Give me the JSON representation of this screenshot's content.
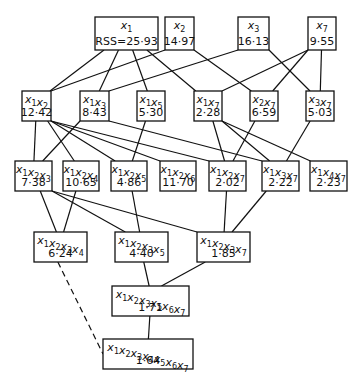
{
  "diagram": {
    "nodes": [
      {
        "id": "x1",
        "vars": [
          1
        ],
        "value": "RSS=25·93",
        "x": 95,
        "y": 17,
        "w": 63,
        "h": 33
      },
      {
        "id": "x2",
        "vars": [
          2
        ],
        "value": "14·97",
        "x": 165,
        "y": 17,
        "w": 29,
        "h": 33
      },
      {
        "id": "x3",
        "vars": [
          3
        ],
        "value": "16·13",
        "x": 238,
        "y": 17,
        "w": 31,
        "h": 33
      },
      {
        "id": "x7",
        "vars": [
          7
        ],
        "value": "9·55",
        "x": 308,
        "y": 17,
        "w": 28,
        "h": 33
      },
      {
        "id": "x1x2",
        "vars": [
          1,
          2
        ],
        "value": "12·42",
        "x": 22,
        "y": 91,
        "w": 29,
        "h": 30
      },
      {
        "id": "x1x3",
        "vars": [
          1,
          3
        ],
        "value": "8·43",
        "x": 80,
        "y": 91,
        "w": 29,
        "h": 30
      },
      {
        "id": "x1x5",
        "vars": [
          1,
          5
        ],
        "value": "5·30",
        "x": 137,
        "y": 91,
        "w": 28,
        "h": 30
      },
      {
        "id": "x1x7",
        "vars": [
          1,
          7
        ],
        "value": "2·28",
        "x": 194,
        "y": 91,
        "w": 28,
        "h": 30
      },
      {
        "id": "x2x7",
        "vars": [
          2,
          7
        ],
        "value": "6·59",
        "x": 250,
        "y": 91,
        "w": 28,
        "h": 30
      },
      {
        "id": "x3x7",
        "vars": [
          3,
          7
        ],
        "value": "5·03",
        "x": 306,
        "y": 91,
        "w": 28,
        "h": 30
      },
      {
        "id": "x1x2x3",
        "vars": [
          1,
          2,
          3
        ],
        "value": "7·38",
        "x": 15,
        "y": 161,
        "w": 37,
        "h": 30
      },
      {
        "id": "x1x2x4",
        "vars": [
          1,
          2,
          4
        ],
        "value": "10·65",
        "x": 63,
        "y": 161,
        "w": 36,
        "h": 30
      },
      {
        "id": "x1x2x5",
        "vars": [
          1,
          2,
          5
        ],
        "value": "4·86",
        "x": 111,
        "y": 161,
        "w": 36,
        "h": 30
      },
      {
        "id": "x1x2x6",
        "vars": [
          1,
          2,
          6
        ],
        "value": "11·70",
        "x": 160,
        "y": 161,
        "w": 36,
        "h": 30
      },
      {
        "id": "x1x2x7",
        "vars": [
          1,
          2,
          7
        ],
        "value": "2·02",
        "x": 209,
        "y": 161,
        "w": 37,
        "h": 30
      },
      {
        "id": "x1x3x7",
        "vars": [
          1,
          3,
          7
        ],
        "value": "2·22",
        "x": 262,
        "y": 161,
        "w": 37,
        "h": 30
      },
      {
        "id": "x1x4x7",
        "vars": [
          1,
          4,
          7
        ],
        "value": "2·23",
        "x": 310,
        "y": 161,
        "w": 37,
        "h": 30
      },
      {
        "id": "x1x2x3x4",
        "vars": [
          1,
          2,
          3,
          4
        ],
        "value": "6·24",
        "x": 34,
        "y": 232,
        "w": 53,
        "h": 30
      },
      {
        "id": "x1x2x3x5",
        "vars": [
          1,
          2,
          3,
          5
        ],
        "value": "4·40",
        "x": 115,
        "y": 232,
        "w": 53,
        "h": 30
      },
      {
        "id": "x1x2x3x7",
        "vars": [
          1,
          2,
          3,
          7
        ],
        "value": "1·85",
        "x": 197,
        "y": 232,
        "w": 53,
        "h": 30
      },
      {
        "id": "x1x2x3x5x6x7",
        "vars": [
          1,
          2,
          3,
          5,
          6,
          7
        ],
        "value": "1·71",
        "x": 112,
        "y": 286,
        "w": 77,
        "h": 30
      },
      {
        "id": "x1x2x3x4x5x6x7",
        "vars": [
          1,
          2,
          3,
          4,
          5,
          6,
          7
        ],
        "value": "1·64",
        "x": 103,
        "y": 339,
        "w": 90,
        "h": 30
      }
    ],
    "edges": [
      {
        "from": "x1",
        "to": "x1x2"
      },
      {
        "from": "x1",
        "to": "x1x3"
      },
      {
        "from": "x1",
        "to": "x1x5"
      },
      {
        "from": "x1",
        "to": "x1x7"
      },
      {
        "from": "x2",
        "to": "x1x2"
      },
      {
        "from": "x2",
        "to": "x2x7"
      },
      {
        "from": "x3",
        "to": "x1x3"
      },
      {
        "from": "x3",
        "to": "x3x7"
      },
      {
        "from": "x7",
        "to": "x1x7"
      },
      {
        "from": "x7",
        "to": "x2x7"
      },
      {
        "from": "x7",
        "to": "x3x7"
      },
      {
        "from": "x1x2",
        "to": "x1x2x3"
      },
      {
        "from": "x1x2",
        "to": "x1x2x4"
      },
      {
        "from": "x1x2",
        "to": "x1x2x5"
      },
      {
        "from": "x1x2",
        "to": "x1x2x6"
      },
      {
        "from": "x1x2",
        "to": "x1x2x7"
      },
      {
        "from": "x1x3",
        "to": "x1x2x3"
      },
      {
        "from": "x1x3",
        "to": "x1x3x7"
      },
      {
        "from": "x1x5",
        "to": "x1x2x5"
      },
      {
        "from": "x1x7",
        "to": "x1x2x7"
      },
      {
        "from": "x1x7",
        "to": "x1x3x7"
      },
      {
        "from": "x1x7",
        "to": "x1x4x7"
      },
      {
        "from": "x2x7",
        "to": "x1x2x7"
      },
      {
        "from": "x3x7",
        "to": "x1x3x7"
      },
      {
        "from": "x1x2x3",
        "to": "x1x2x3x4"
      },
      {
        "from": "x1x2x3",
        "to": "x1x2x3x5"
      },
      {
        "from": "x1x2x3",
        "to": "x1x2x3x7"
      },
      {
        "from": "x1x2x4",
        "to": "x1x2x3x4"
      },
      {
        "from": "x1x2x5",
        "to": "x1x2x3x5"
      },
      {
        "from": "x1x2x7",
        "to": "x1x2x3x7"
      },
      {
        "from": "x1x3x7",
        "to": "x1x2x3x7"
      },
      {
        "from": "x1x2x3x5",
        "to": "x1x2x3x5x6x7"
      },
      {
        "from": "x1x2x3x7",
        "to": "x1x2x3x5x6x7"
      },
      {
        "from": "x1x2x3x5x6x7",
        "to": "x1x2x3x4x5x6x7"
      },
      {
        "from": "x1x2x3x4",
        "to": "x1x2x3x4x5x6x7",
        "dashed": true
      }
    ]
  }
}
